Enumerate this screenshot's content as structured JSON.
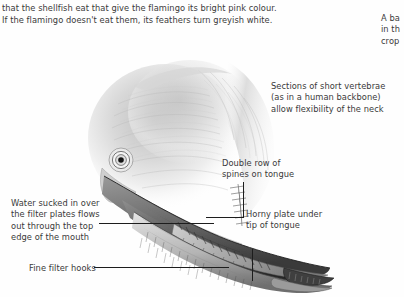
{
  "page": {
    "background_color": "#fefefe",
    "text_color": "#3a3a3a",
    "leader_line_color": "#1d1d1d"
  },
  "body_text": "that the shellfish eat that give the flamingo its bright pink colour.\nIf the flamingo doesn't eat them, its feathers turn greyish white.",
  "right_column_clipped": "A ba\nin th\ncrop",
  "annotations": {
    "vertebrae": "Sections of short vertebrae\n(as in a human backbone)\nallow flexibility of the neck",
    "spines": "Double row of\nspines on tongue",
    "horny_plate": "Horny plate under\ntip of tongue",
    "water_flow": "Water sucked in over\nthe filter plates flows\nout through the top\nedge of the mouth",
    "filter_hooks": "Fine filter hooks"
  },
  "illustration": {
    "subject": "flamingo-head-beak-cutaway",
    "style": "grayscale-pencil-drawing",
    "parts": [
      "head",
      "eye",
      "upper-mandible",
      "lower-mandible",
      "tongue",
      "filter-plates",
      "beak-tip"
    ]
  }
}
